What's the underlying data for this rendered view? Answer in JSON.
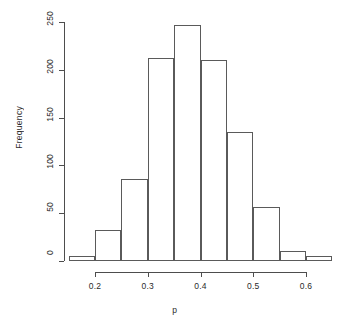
{
  "chart_data": {
    "type": "bar",
    "title": "",
    "subtitle": "",
    "xlabel": "p",
    "ylabel": "Frequency",
    "xlim": [
      0.15,
      0.65
    ],
    "ylim": [
      0,
      250
    ],
    "grid": false,
    "legend": null,
    "bin_width": 0.05,
    "bin_edges": [
      0.15,
      0.2,
      0.25,
      0.3,
      0.35,
      0.4,
      0.45,
      0.5,
      0.55,
      0.6,
      0.65
    ],
    "categories": [
      "0.15-0.20",
      "0.20-0.25",
      "0.25-0.30",
      "0.30-0.35",
      "0.35-0.40",
      "0.40-0.45",
      "0.45-0.50",
      "0.50-0.55",
      "0.55-0.60",
      "0.60-0.65"
    ],
    "values": [
      5,
      32,
      86,
      212,
      247,
      210,
      135,
      57,
      10,
      5
    ],
    "x_ticks": [
      0.2,
      0.3,
      0.4,
      0.5,
      0.6
    ],
    "x_tick_labels": [
      "0.2",
      "0.3",
      "0.4",
      "0.5",
      "0.6"
    ],
    "y_ticks": [
      0,
      50,
      100,
      150,
      200,
      250
    ],
    "y_tick_labels": [
      "0",
      "50",
      "100",
      "150",
      "200",
      "250"
    ],
    "bar_face_color": "#ffffff",
    "bar_edge_color": "#5a5a5a",
    "axis_color": "#4d4d4d",
    "background_color": "#ffffff"
  },
  "axes": {
    "y_title": "Frequency",
    "x_title": "p"
  }
}
